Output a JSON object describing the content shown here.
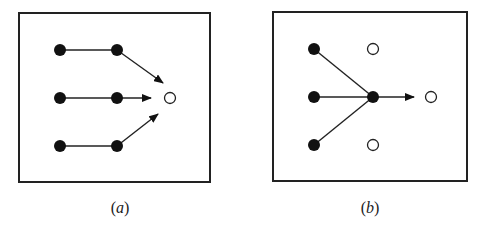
{
  "panels": [
    {
      "id": "a",
      "label_open": "(",
      "label_var": "a",
      "label_close": ")",
      "frame": {
        "x": 19,
        "y": 13,
        "w": 191,
        "h": 169
      },
      "filled_nodes": [
        [
          60,
          50
        ],
        [
          117,
          50
        ],
        [
          60,
          98
        ],
        [
          117,
          98
        ],
        [
          60,
          146
        ],
        [
          117,
          146
        ]
      ],
      "open_nodes": [
        [
          170,
          98
        ]
      ],
      "lines": [
        [
          60,
          50,
          117,
          50
        ],
        [
          60,
          98,
          117,
          98
        ],
        [
          60,
          146,
          117,
          146
        ]
      ],
      "arrows": [
        [
          117,
          50,
          163,
          83
        ],
        [
          117,
          98,
          151,
          98
        ],
        [
          117,
          146,
          158,
          114
        ]
      ]
    },
    {
      "id": "b",
      "label_open": "(",
      "label_var": "b",
      "label_close": ")",
      "frame": {
        "x": 273,
        "y": 12,
        "w": 194,
        "h": 169
      },
      "filled_nodes": [
        [
          314,
          49
        ],
        [
          314,
          97
        ],
        [
          314,
          145
        ],
        [
          373,
          97
        ]
      ],
      "open_nodes": [
        [
          373,
          49
        ],
        [
          373,
          145
        ],
        [
          431,
          97
        ]
      ],
      "lines": [
        [
          314,
          49,
          373,
          97
        ],
        [
          314,
          97,
          373,
          97
        ],
        [
          314,
          145,
          373,
          97
        ]
      ],
      "arrows": [
        [
          373,
          97,
          414,
          97
        ]
      ]
    }
  ],
  "colors": {
    "stroke": "#222222",
    "fill": "#111111",
    "open_fill": "#ffffff"
  }
}
